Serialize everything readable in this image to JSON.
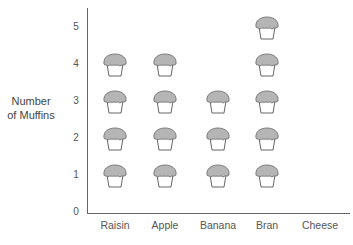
{
  "chart_data": {
    "type": "pictograph",
    "title": "",
    "xlabel": "",
    "ylabel": "Number of Muffins",
    "ylabel_lines": [
      "Number",
      "of Muffins"
    ],
    "categories": [
      "Raisin",
      "Apple",
      "Banana",
      "Bran",
      "Cheese"
    ],
    "values": [
      4,
      4,
      3,
      5,
      0
    ],
    "yticks": [
      "0",
      "1",
      "2",
      "3",
      "4",
      "5"
    ],
    "ylim": [
      0,
      5
    ],
    "symbol": "muffin-icon",
    "grid": false,
    "legend": null
  },
  "colors": {
    "muffin_top": "#b5b5b5",
    "muffin_outline": "#666666",
    "axis": "#666666",
    "text": "#555555"
  }
}
